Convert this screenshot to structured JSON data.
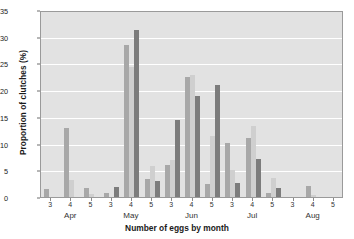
{
  "chart_data": {
    "type": "bar",
    "title": "",
    "xlabel": "Number of eggs by month",
    "ylabel": "Proportion of clutches (%)",
    "ylim": [
      0,
      35
    ],
    "yticks": [
      0,
      5,
      10,
      15,
      20,
      25,
      30,
      35
    ],
    "grid": true,
    "legend": "none",
    "group_labels": [
      "3",
      "4",
      "5",
      "3",
      "4",
      "5",
      "3",
      "4",
      "5",
      "3",
      "4",
      "5",
      "3",
      "4",
      "5"
    ],
    "months": [
      "Apr",
      "May",
      "Jun",
      "Jul",
      "Aug"
    ],
    "eggs_per_month": [
      "3",
      "4",
      "5"
    ],
    "series": [
      {
        "name": "series-1",
        "values": [
          1.5,
          13.0,
          1.7,
          0.8,
          28.5,
          3.3,
          6.0,
          22.5,
          2.5,
          10.2,
          11.0,
          0.7,
          0.0,
          2.0,
          0.0
        ]
      },
      {
        "name": "series-2",
        "values": [
          0.0,
          3.1,
          0.6,
          0.0,
          24.4,
          5.8,
          7.0,
          22.8,
          11.5,
          5.0,
          13.2,
          3.5,
          0.0,
          0.3,
          0.0
        ]
      },
      {
        "name": "series-3",
        "values": [
          0.0,
          0.0,
          0.0,
          1.8,
          31.2,
          3.0,
          14.5,
          19.0,
          21.0,
          2.6,
          7.2,
          1.6,
          0.0,
          0.0,
          0.0
        ]
      }
    ],
    "groups": [
      {
        "month": "Apr",
        "eggs": "3",
        "values": [
          1.5,
          0.0,
          0.0
        ]
      },
      {
        "month": "Apr",
        "eggs": "4",
        "values": [
          13.0,
          3.1,
          0.0
        ]
      },
      {
        "month": "Apr",
        "eggs": "5",
        "values": [
          1.7,
          0.6,
          0.0
        ]
      },
      {
        "month": "May",
        "eggs": "3",
        "values": [
          0.8,
          0.0,
          1.8
        ]
      },
      {
        "month": "May",
        "eggs": "4",
        "values": [
          28.5,
          24.4,
          31.2
        ]
      },
      {
        "month": "May",
        "eggs": "5",
        "values": [
          3.3,
          5.8,
          3.0
        ]
      },
      {
        "month": "Jun",
        "eggs": "3",
        "values": [
          6.0,
          7.0,
          14.5
        ]
      },
      {
        "month": "Jun",
        "eggs": "4",
        "values": [
          22.5,
          22.8,
          19.0
        ]
      },
      {
        "month": "Jun",
        "eggs": "5",
        "values": [
          2.5,
          11.5,
          21.0
        ]
      },
      {
        "month": "Jul",
        "eggs": "3",
        "values": [
          10.2,
          5.0,
          2.6
        ]
      },
      {
        "month": "Jul",
        "eggs": "4",
        "values": [
          11.0,
          13.2,
          7.2
        ]
      },
      {
        "month": "Jul",
        "eggs": "5",
        "values": [
          0.7,
          3.5,
          1.6
        ]
      },
      {
        "month": "Aug",
        "eggs": "3",
        "values": [
          0.0,
          0.0,
          0.0
        ]
      },
      {
        "month": "Aug",
        "eggs": "4",
        "values": [
          2.0,
          0.3,
          0.0
        ]
      },
      {
        "month": "Aug",
        "eggs": "5",
        "values": [
          0.0,
          0.0,
          0.0
        ]
      }
    ],
    "colors": {
      "series_1": "#a8a8a8",
      "series_2": "#cfcfcf",
      "series_3": "#7c7c7c",
      "plot_background": "#e2e2e2",
      "gridline": "#ffffff",
      "axis": "#9a9a9a"
    }
  }
}
